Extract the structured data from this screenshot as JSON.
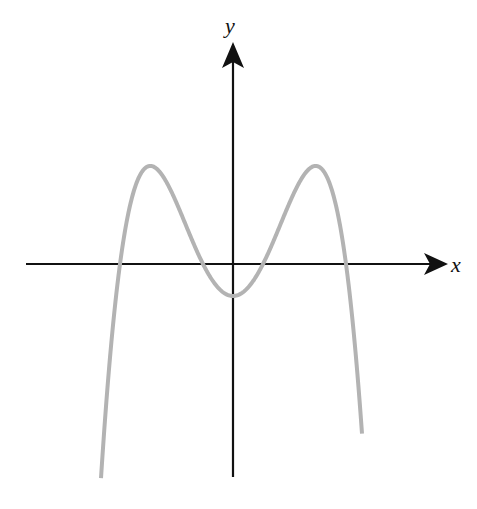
{
  "diagram": {
    "type": "function-graph",
    "x_axis": {
      "label": "x"
    },
    "y_axis": {
      "label": "y"
    },
    "colors": {
      "axis": "#111111",
      "curve": "#b3b3b3",
      "background": "#ffffff"
    },
    "pixel_geometry": {
      "origin": [
        233,
        264
      ],
      "x_axis_range_px": [
        26,
        448
      ],
      "y_axis_range_px": [
        477,
        42
      ],
      "roots_px_offset": [
        -113,
        -30,
        30,
        113
      ],
      "y_intercept_px_offset": -32,
      "curve_x_extent_px": [
        101,
        362
      ]
    },
    "features": {
      "roots": 4,
      "local_maxima": 2,
      "local_minima": 1,
      "symmetry": "even (symmetric about y-axis)",
      "end_behavior": "y → -∞ as x → ±∞"
    }
  }
}
